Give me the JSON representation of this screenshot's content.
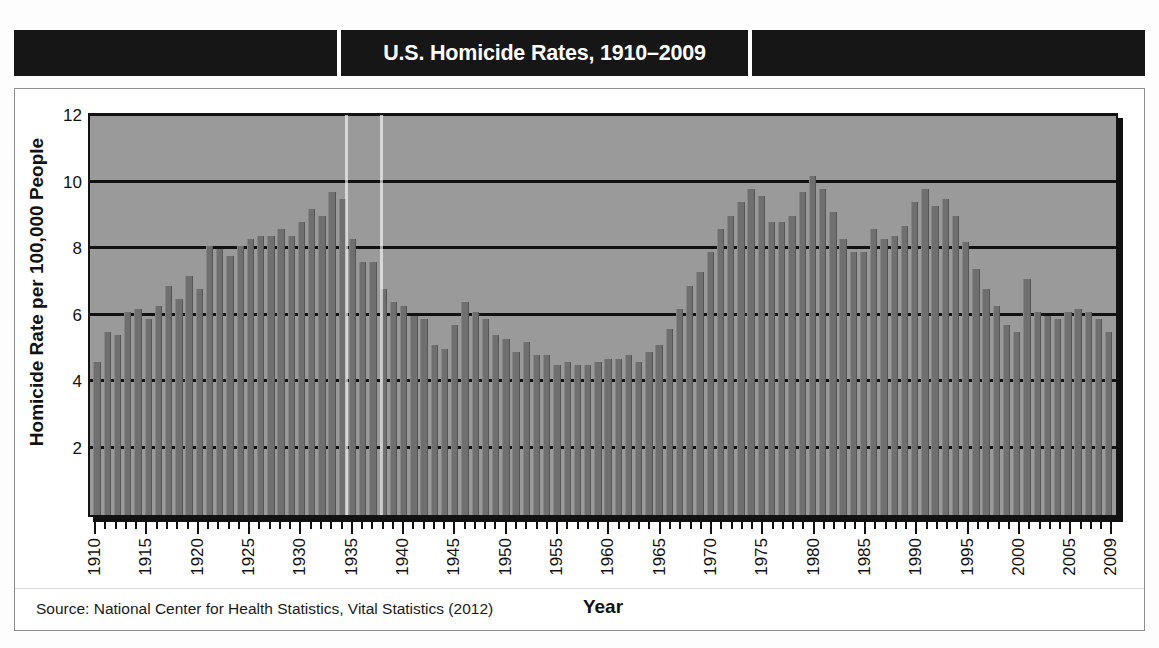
{
  "header": {
    "title": "U.S. Homicide Rates, 1910–2009"
  },
  "source": {
    "note": "Source: National Center for Health Statistics, Vital Statistics (2012)"
  },
  "chart_data": {
    "type": "bar",
    "title": "U.S. Homicide Rates, 1910–2009",
    "xlabel": "Year",
    "ylabel": "Homicide Rate per 100,000 People",
    "ylim": [
      0,
      12
    ],
    "yticks": [
      12,
      10,
      8,
      6,
      4,
      2
    ],
    "grid": true,
    "legend": "none",
    "xtick_labels": [
      "1910",
      "1915",
      "1920",
      "1925",
      "1930",
      "1935",
      "1940",
      "1945",
      "1950",
      "1955",
      "1960",
      "1965",
      "1970",
      "1975",
      "1980",
      "1985",
      "1990",
      "1995",
      "2000",
      "2005",
      "2009"
    ],
    "bar_color": "#6f6f6f",
    "plot_background": "#9a9a9a",
    "categories": [
      1910,
      1911,
      1912,
      1913,
      1914,
      1915,
      1916,
      1917,
      1918,
      1919,
      1920,
      1921,
      1922,
      1923,
      1924,
      1925,
      1926,
      1927,
      1928,
      1929,
      1930,
      1931,
      1932,
      1933,
      1934,
      1935,
      1936,
      1937,
      1938,
      1939,
      1940,
      1941,
      1942,
      1943,
      1944,
      1945,
      1946,
      1947,
      1948,
      1949,
      1950,
      1951,
      1952,
      1953,
      1954,
      1955,
      1956,
      1957,
      1958,
      1959,
      1960,
      1961,
      1962,
      1963,
      1964,
      1965,
      1966,
      1967,
      1968,
      1969,
      1970,
      1971,
      1972,
      1973,
      1974,
      1975,
      1976,
      1977,
      1978,
      1979,
      1980,
      1981,
      1982,
      1983,
      1984,
      1985,
      1986,
      1987,
      1988,
      1989,
      1990,
      1991,
      1992,
      1993,
      1994,
      1995,
      1996,
      1997,
      1998,
      1999,
      2000,
      2001,
      2002,
      2003,
      2004,
      2005,
      2006,
      2007,
      2008,
      2009
    ],
    "values": [
      4.6,
      5.5,
      5.4,
      6.1,
      6.2,
      5.9,
      6.3,
      6.9,
      6.5,
      7.2,
      6.8,
      8.1,
      8.0,
      7.8,
      8.1,
      8.3,
      8.4,
      8.4,
      8.6,
      8.4,
      8.8,
      9.2,
      9.0,
      9.7,
      9.5,
      8.3,
      7.6,
      7.6,
      6.8,
      6.4,
      6.3,
      6.0,
      5.9,
      5.1,
      5.0,
      5.7,
      6.4,
      6.1,
      5.9,
      5.4,
      5.3,
      4.9,
      5.2,
      4.8,
      4.8,
      4.5,
      4.6,
      4.5,
      4.5,
      4.6,
      4.7,
      4.7,
      4.8,
      4.6,
      4.9,
      5.1,
      5.6,
      6.2,
      6.9,
      7.3,
      7.9,
      8.6,
      9.0,
      9.4,
      9.8,
      9.6,
      8.8,
      8.8,
      9.0,
      9.7,
      10.2,
      9.8,
      9.1,
      8.3,
      7.9,
      7.9,
      8.6,
      8.3,
      8.4,
      8.7,
      9.4,
      9.8,
      9.3,
      9.5,
      9.0,
      8.2,
      7.4,
      6.8,
      6.3,
      5.7,
      5.5,
      7.1,
      6.1,
      6.0,
      5.9,
      6.1,
      6.2,
      6.1,
      5.9,
      5.5
    ]
  }
}
